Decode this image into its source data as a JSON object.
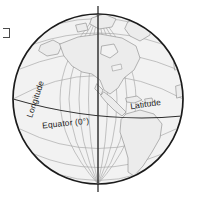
{
  "figure": {
    "kind": "globe-diagram",
    "background_color": "#ffffff",
    "globe": {
      "center_x": 98,
      "center_y": 99,
      "radius": 85,
      "fill_color": "#f2f2f2",
      "outline_color": "#1b1b1b",
      "graticule_color": "#9a9a9a",
      "coastline_color": "#7d7d7d",
      "land_fill_color": "#ececec"
    },
    "axis": {
      "name": "rotation-axis",
      "color": "#2d2d2d",
      "x": 98,
      "top_y": 6,
      "bottom_y": 192
    },
    "equator_line": {
      "name": "equator",
      "color": "#2d2d2d"
    }
  },
  "labels": {
    "longitude": "Longitude",
    "latitude": "Latitude",
    "equator": "Equator (0°)"
  },
  "annotations": {
    "edge_mark": "cropped-edge-artifact"
  }
}
